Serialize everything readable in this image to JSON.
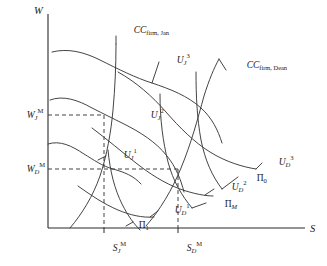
{
  "figure": {
    "type": "economics-indifference-curve-diagram",
    "background": "#ffffff",
    "ink_color": "#3a3a3a"
  },
  "axes": {
    "y_label": "W",
    "x_label": "S",
    "origin": {
      "x": 48,
      "y": 228
    },
    "y_top": {
      "x": 48,
      "y": 14
    },
    "x_right": {
      "x": 305,
      "y": 228
    }
  },
  "gridlines": {
    "y_ticks": [
      {
        "id": "WJM",
        "base": "W",
        "sub": "J",
        "sup": "M",
        "pixel_y": 115,
        "label_x": 10,
        "label_y": 118
      },
      {
        "id": "WDM",
        "base": "W",
        "sub": "D",
        "sup": "M",
        "pixel_y": 169,
        "label_x": 10,
        "label_y": 172
      }
    ],
    "x_ticks": [
      {
        "id": "SJM",
        "base": "S",
        "sub": "J",
        "sup": "M",
        "pixel_x": 104,
        "label_x": 96,
        "label_y": 251
      },
      {
        "id": "SDM",
        "base": "S",
        "sub": "D",
        "sup": "M",
        "pixel_x": 178,
        "label_x": 170,
        "label_y": 251
      }
    ]
  },
  "curves": {
    "cc_firm_jan": {
      "name": "CC firm Jan",
      "label_base": "CC",
      "label_sub": "firm, Jan",
      "label_x": 117,
      "label_y": 33,
      "path": "M 70,228 C 82,214 93,196 100,176 C 107,155 111,132 113,110 C 115,88 116,66 116,44"
    },
    "cc_firm_dean": {
      "name": "CC firm Dean",
      "label_base": "CC",
      "label_sub": "firm, Dean",
      "label_x": 230,
      "label_y": 68,
      "path": "M 146,226 C 160,210 172,190 181,168 C 191,144 198,118 204,96 C 209,80 214,68 219,59"
    },
    "u_jan_3": {
      "name": "U Jan 3",
      "label_base": "U",
      "label_sub": "J",
      "label_sup": "3",
      "label_x": 160,
      "label_y": 63,
      "path": "M 52,52 C 68,48 84,52 100,60 C 118,69 136,78 152,83 C 170,89 188,96 201,108 C 212,118 218,130 222,143"
    },
    "u_jan_2": {
      "name": "U Jan 2",
      "label_base": "U",
      "label_sub": "J",
      "label_sup": "2",
      "label_x": 134,
      "label_y": 118,
      "path": "M 50,100 C 63,95 78,100 92,108 C 104,114 112,118 124,124 C 140,132 156,142 167,156 C 176,167 181,180 184,192"
    },
    "u_jan_1": {
      "name": "U Jan 1",
      "label_base": "U",
      "label_sub": "J",
      "label_sup": "1",
      "label_x": 107,
      "label_y": 158,
      "path": "M 48,144 C 60,140 72,146 84,154 C 94,160 102,166 113,169 C 124,172 134,176 141,184"
    },
    "u_dean_3": {
      "name": "U Dean 3",
      "label_base": "U",
      "label_sub": "D",
      "label_sup": "3",
      "label_x": 262,
      "label_y": 165,
      "path": "M 118,72 C 136,82 152,96 166,112 C 180,128 194,142 210,152 C 226,162 243,167 256,169"
    },
    "u_dean_2": {
      "name": "U Dean 2",
      "label_base": "U",
      "label_sub": "D",
      "label_sup": "2",
      "label_x": 215,
      "label_y": 190,
      "path": "M 92,128 C 108,140 122,152 136,163 C 150,174 164,183 180,189 C 194,194 206,196 213,196"
    },
    "u_dean_1": {
      "name": "U Dean 1",
      "label_base": "U",
      "label_sub": "D",
      "label_sup": "1",
      "label_x": 158,
      "label_y": 213,
      "path": "M 78,186 C 92,196 104,204 118,210 C 130,215 142,218 154,217"
    },
    "pi_0": {
      "name": "Pi 0",
      "label_base": "Π",
      "label_sub": "0",
      "label_x": 240,
      "label_y": 181,
      "path": "M 196,72 C 196,96 197,118 201,140 C 205,160 212,176 222,189"
    },
    "pi_m": {
      "name": "Pi M",
      "label_base": "Π",
      "label_sub": "M",
      "label_x": 208,
      "label_y": 207,
      "path": "M 160,94 C 160,120 163,142 168,162 C 173,181 182,196 192,208"
    },
    "pi_1": {
      "name": "Pi 1",
      "label_base": "Π",
      "label_sub": "1",
      "label_x": 122,
      "label_y": 228,
      "path": "M 108,150 C 110,172 115,190 122,204 C 128,216 134,224 140,230"
    }
  },
  "equilibria": [
    {
      "name": "jan-equilibrium",
      "x": 104,
      "y": 115
    },
    {
      "name": "dean-equilibrium",
      "x": 178,
      "y": 169
    }
  ]
}
